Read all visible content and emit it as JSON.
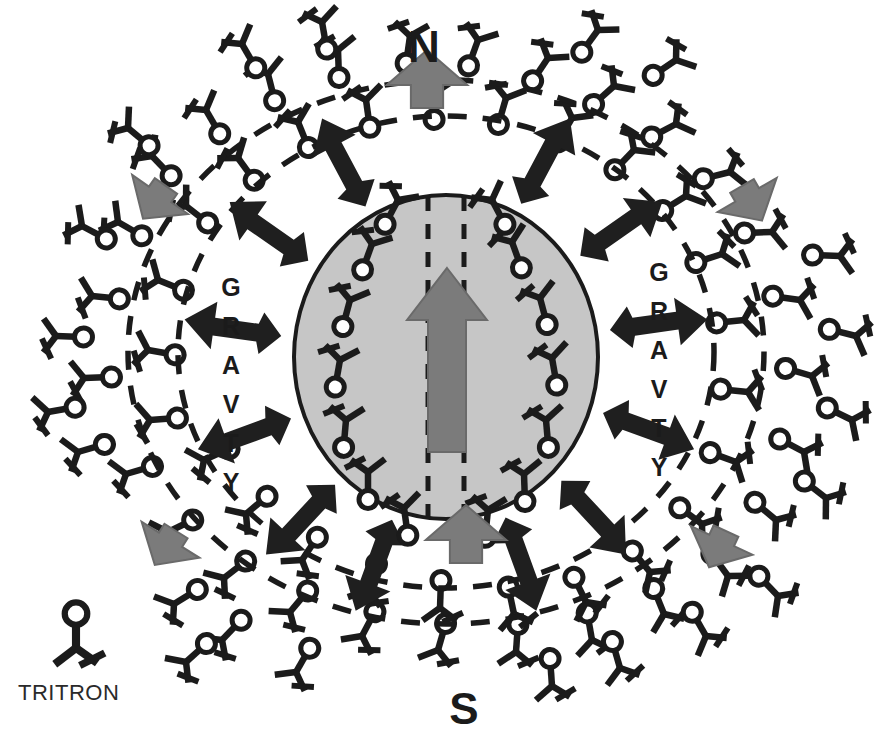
{
  "diagram": {
    "title_north": "N",
    "title_south": "S",
    "gravity_label_left": "GRAVTY",
    "gravity_label_right": "GRAVTY",
    "legend": {
      "label": "TRITRON",
      "icon": "tritron-molecule-icon"
    },
    "colors": {
      "ink": "#1b1b1b",
      "core_fill": "#c6c6c6",
      "core_stroke": "#1b1b1b",
      "axis_arrow": "#7b7b7b",
      "flow_arrow": "#7b7b7b",
      "gravity_arrow": "#1f1f1f",
      "background": "#ffffff"
    },
    "core": {
      "center_x": 446,
      "center_y": 357,
      "radius_x": 152,
      "radius_y": 162,
      "dashed_axis": true
    },
    "field_boundaries": [
      {
        "name": "inner-field-ellipse",
        "cx": 446,
        "cy": 352,
        "rx": 268,
        "ry": 236
      },
      {
        "name": "outer-field-ellipse",
        "cx": 446,
        "cy": 352,
        "rx": 318,
        "ry": 272
      }
    ],
    "magnetic_axis": {
      "name": "magnetic-axis-arrow",
      "direction": "north",
      "internal_arrow": true
    },
    "flow_arrows": [
      {
        "name": "flow-arrow-north-out",
        "x": 427,
        "y": 108,
        "angle": 0,
        "len": 58,
        "w": 26
      },
      {
        "name": "flow-arrow-south-in",
        "x": 466,
        "y": 563,
        "angle": 0,
        "len": 58,
        "w": 26
      },
      {
        "name": "flow-arrow-upper-left",
        "x": 166,
        "y": 186,
        "angle": 215,
        "len": 40,
        "w": 22
      },
      {
        "name": "flow-arrow-upper-right",
        "x": 742,
        "y": 186,
        "angle": 150,
        "len": 40,
        "w": 22
      },
      {
        "name": "flow-arrow-lower-left",
        "x": 176,
        "y": 531,
        "angle": 212,
        "len": 40,
        "w": 22
      },
      {
        "name": "flow-arrow-lower-right",
        "x": 726,
        "y": 531,
        "angle": 205,
        "len": 40,
        "w": 22
      }
    ],
    "gravity_arrows": [
      {
        "name": "gravity-arrow-1",
        "angle": 298
      },
      {
        "name": "gravity-arrow-2",
        "angle": 325
      },
      {
        "name": "gravity-arrow-3",
        "angle": 352
      },
      {
        "name": "gravity-arrow-4",
        "angle": 20
      },
      {
        "name": "gravity-arrow-5",
        "angle": 47
      },
      {
        "name": "gravity-arrow-6",
        "angle": 70
      },
      {
        "name": "gravity-arrow-7",
        "angle": 110
      },
      {
        "name": "gravity-arrow-8",
        "angle": 133
      },
      {
        "name": "gravity-arrow-9",
        "angle": 160
      },
      {
        "name": "gravity-arrow-10",
        "angle": 188
      },
      {
        "name": "gravity-arrow-11",
        "angle": 215
      },
      {
        "name": "gravity-arrow-12",
        "angle": 242
      }
    ],
    "core_molecules": [
      {
        "x": 372,
        "y": 244,
        "rot": 200
      },
      {
        "x": 512,
        "y": 242,
        "rot": 160
      },
      {
        "x": 350,
        "y": 300,
        "rot": 195
      },
      {
        "x": 540,
        "y": 298,
        "rot": 165
      },
      {
        "x": 340,
        "y": 360,
        "rot": 190
      },
      {
        "x": 552,
        "y": 358,
        "rot": 170
      },
      {
        "x": 346,
        "y": 420,
        "rot": 185
      },
      {
        "x": 546,
        "y": 420,
        "rot": 175
      },
      {
        "x": 368,
        "y": 472,
        "rot": 180
      },
      {
        "x": 524,
        "y": 474,
        "rot": 178
      },
      {
        "x": 398,
        "y": 200,
        "rot": 208
      },
      {
        "x": 492,
        "y": 200,
        "rot": 152
      },
      {
        "x": 404,
        "y": 508,
        "rot": 172
      },
      {
        "x": 488,
        "y": 510,
        "rot": 186
      }
    ],
    "halo_molecules": [
      {
        "x": 92,
        "y": 296,
        "rot": 96
      },
      {
        "x": 84,
        "y": 378,
        "rot": 88
      },
      {
        "x": 78,
        "y": 452,
        "rot": 74
      },
      {
        "x": 118,
        "y": 222,
        "rot": 120
      },
      {
        "x": 152,
        "y": 156,
        "rot": 136
      },
      {
        "x": 206,
        "y": 110,
        "rot": 150
      },
      {
        "x": 268,
        "y": 74,
        "rot": 166
      },
      {
        "x": 338,
        "y": 50,
        "rot": 178
      },
      {
        "x": 410,
        "y": 36,
        "rot": 188
      },
      {
        "x": 478,
        "y": 40,
        "rot": 200
      },
      {
        "x": 548,
        "y": 58,
        "rot": 214
      },
      {
        "x": 614,
        "y": 86,
        "rot": 228
      },
      {
        "x": 676,
        "y": 124,
        "rot": 242
      },
      {
        "x": 730,
        "y": 172,
        "rot": 256
      },
      {
        "x": 772,
        "y": 232,
        "rot": 268
      },
      {
        "x": 800,
        "y": 300,
        "rot": 278
      },
      {
        "x": 812,
        "y": 376,
        "rot": 286
      },
      {
        "x": 804,
        "y": 452,
        "rot": 298
      },
      {
        "x": 776,
        "y": 520,
        "rot": 310
      },
      {
        "x": 728,
        "y": 576,
        "rot": 324
      },
      {
        "x": 664,
        "y": 614,
        "rot": 338
      },
      {
        "x": 592,
        "y": 640,
        "rot": 350
      },
      {
        "x": 516,
        "y": 652,
        "rot": 4
      },
      {
        "x": 438,
        "y": 650,
        "rot": 16
      },
      {
        "x": 362,
        "y": 636,
        "rot": 28
      },
      {
        "x": 290,
        "y": 612,
        "rot": 40
      },
      {
        "x": 224,
        "y": 578,
        "rot": 52
      },
      {
        "x": 168,
        "y": 532,
        "rot": 64
      },
      {
        "x": 126,
        "y": 474,
        "rot": 74
      },
      {
        "x": 158,
        "y": 280,
        "rot": 112
      },
      {
        "x": 148,
        "y": 350,
        "rot": 100
      },
      {
        "x": 150,
        "y": 420,
        "rot": 86
      },
      {
        "x": 186,
        "y": 206,
        "rot": 128
      },
      {
        "x": 238,
        "y": 158,
        "rot": 144
      },
      {
        "x": 298,
        "y": 122,
        "rot": 158
      },
      {
        "x": 366,
        "y": 100,
        "rot": 172
      },
      {
        "x": 436,
        "y": 92,
        "rot": 184
      },
      {
        "x": 506,
        "y": 98,
        "rot": 196
      },
      {
        "x": 572,
        "y": 118,
        "rot": 210
      },
      {
        "x": 634,
        "y": 150,
        "rot": 224
      },
      {
        "x": 686,
        "y": 196,
        "rot": 238
      },
      {
        "x": 722,
        "y": 254,
        "rot": 252
      },
      {
        "x": 744,
        "y": 320,
        "rot": 264
      },
      {
        "x": 748,
        "y": 392,
        "rot": 276
      },
      {
        "x": 736,
        "y": 462,
        "rot": 290
      },
      {
        "x": 702,
        "y": 524,
        "rot": 306
      },
      {
        "x": 650,
        "y": 572,
        "rot": 320
      },
      {
        "x": 586,
        "y": 602,
        "rot": 334
      },
      {
        "x": 514,
        "y": 614,
        "rot": 348
      },
      {
        "x": 440,
        "y": 608,
        "rot": 2
      },
      {
        "x": 368,
        "y": 590,
        "rot": 18
      },
      {
        "x": 302,
        "y": 560,
        "rot": 34
      },
      {
        "x": 246,
        "y": 514,
        "rot": 50
      },
      {
        "x": 204,
        "y": 460,
        "rot": 66
      },
      {
        "x": 242,
        "y": 44,
        "rot": 150
      },
      {
        "x": 322,
        "y": 22,
        "rot": 170
      },
      {
        "x": 598,
        "y": 30,
        "rot": 216
      },
      {
        "x": 676,
        "y": 60,
        "rot": 236
      },
      {
        "x": 840,
        "y": 256,
        "rot": 272
      },
      {
        "x": 856,
        "y": 336,
        "rot": 284
      },
      {
        "x": 852,
        "y": 420,
        "rot": 296
      },
      {
        "x": 826,
        "y": 498,
        "rot": 308
      },
      {
        "x": 56,
        "y": 336,
        "rot": 92
      },
      {
        "x": 48,
        "y": 412,
        "rot": 80
      },
      {
        "x": 82,
        "y": 226,
        "rot": 118
      },
      {
        "x": 296,
        "y": 672,
        "rot": 30
      },
      {
        "x": 222,
        "y": 640,
        "rot": 44
      },
      {
        "x": 620,
        "y": 668,
        "rot": 344
      },
      {
        "x": 706,
        "y": 636,
        "rot": 330
      },
      {
        "x": 174,
        "y": 604,
        "rot": 58
      },
      {
        "x": 552,
        "y": 686,
        "rot": 356
      },
      {
        "x": 186,
        "y": 662,
        "rot": 48
      },
      {
        "x": 778,
        "y": 596,
        "rot": 316
      },
      {
        "x": 128,
        "y": 128,
        "rot": 130
      }
    ]
  }
}
